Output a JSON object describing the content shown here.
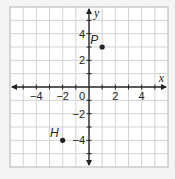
{
  "chart_data": {
    "type": "scatter",
    "title": "",
    "xlabel": "x",
    "ylabel": "y",
    "xlim": [
      -6,
      6
    ],
    "ylim": [
      -6,
      6
    ],
    "grid": true,
    "grid_step": 1,
    "x_tick_labels": [
      {
        "value": -4,
        "label": "−4"
      },
      {
        "value": -2,
        "label": "−2"
      },
      {
        "value": 2,
        "label": "2"
      },
      {
        "value": 4,
        "label": "4"
      }
    ],
    "y_tick_labels": [
      {
        "value": 4,
        "label": "4"
      },
      {
        "value": 2,
        "label": "2"
      },
      {
        "value": -2,
        "label": "−2"
      },
      {
        "value": -4,
        "label": "−4"
      }
    ],
    "origin_label": "0",
    "points": [
      {
        "label": "P",
        "x": 1,
        "y": 3
      },
      {
        "label": "H",
        "x": -2,
        "y": -4
      }
    ]
  },
  "colors": {
    "background": "#f4f4f4",
    "plot_background": "#ffffff",
    "grid": "#c8c8c8",
    "border": "#b4b4b4",
    "axis": "#222222",
    "point": "#222222"
  }
}
